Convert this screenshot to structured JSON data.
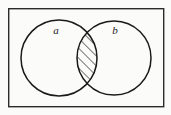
{
  "figure": {
    "kind": "venn-diagram",
    "caption": "",
    "universe": {
      "name": "universal-set-rectangle",
      "x": 8,
      "y": 8,
      "width": 156,
      "height": 99,
      "stroke": "#2b2b2b",
      "stroke_width": 1.4,
      "fill": "#fbfbfa"
    },
    "background_color": "#fbfbfa",
    "stroke_color": "#1a1a1a",
    "sets": [
      {
        "id": "set-a",
        "label": "a",
        "label_x": 56,
        "label_y": 34,
        "cx": 59,
        "cy": 58,
        "r": 38,
        "stroke": "#1a1a1a",
        "stroke_width": 1.5,
        "fill": "none"
      },
      {
        "id": "set-b",
        "label": "b",
        "label_x": 115,
        "label_y": 34,
        "cx": 114,
        "cy": 58,
        "r": 37,
        "stroke": "#1a1a1a",
        "stroke_width": 1.5,
        "fill": "none"
      }
    ],
    "intersection": {
      "id": "intersection-region",
      "label": "a-and-b",
      "shaded": true,
      "shading_style": "diagonal-hatch",
      "hatch_angle_degrees": 45,
      "hatch_spacing": 7,
      "hatch_stroke": "#1a1a1a",
      "hatch_stroke_width": 1.2,
      "top_crossing": {
        "x": 87,
        "y": 32
      },
      "bottom_crossing": {
        "x": 87,
        "y": 84
      }
    }
  }
}
